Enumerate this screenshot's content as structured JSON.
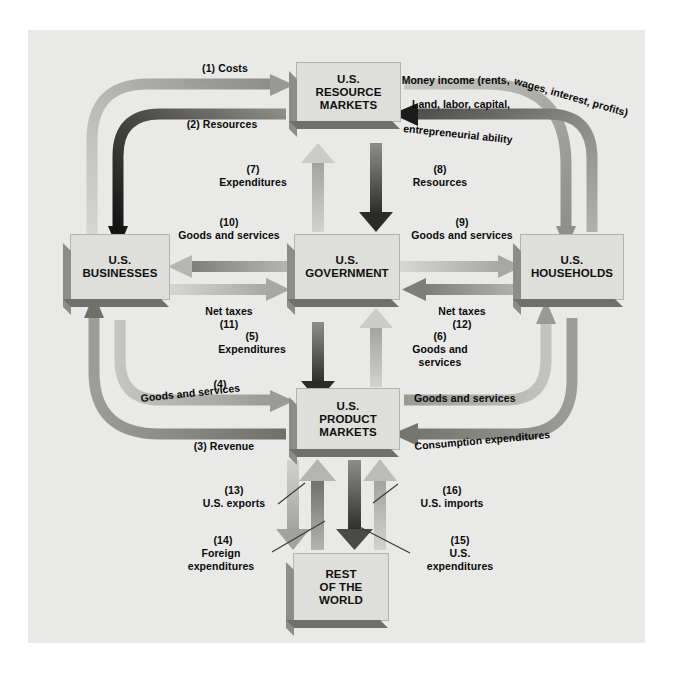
{
  "figure": {
    "type": "diagram",
    "background_color": "#e9e9e7",
    "box_fill": "#dededa"
  },
  "nodes": [
    {
      "id": "resource_markets",
      "label": "U.S.\nRESOURCE\nMARKETS",
      "line1": "U.S.",
      "line2": "RESOURCE",
      "line3": "MARKETS"
    },
    {
      "id": "businesses",
      "label": "U.S.\nBUSINESSES",
      "line1": "U.S.",
      "line2": "BUSINESSES",
      "line3": ""
    },
    {
      "id": "government",
      "label": "U.S.\nGOVERNMENT",
      "line1": "U.S.",
      "line2": "GOVERNMENT",
      "line3": ""
    },
    {
      "id": "households",
      "label": "U.S.\nHOUSEHOLDS",
      "line1": "U.S.",
      "line2": "HOUSEHOLDS",
      "line3": ""
    },
    {
      "id": "product_markets",
      "label": "U.S.\nPRODUCT\nMARKETS",
      "line1": "U.S.",
      "line2": "PRODUCT",
      "line3": "MARKETS"
    },
    {
      "id": "rest_of_world",
      "label": "REST\nOF THE\nWORLD",
      "line1": "REST",
      "line2": "OF THE",
      "line3": "WORLD"
    }
  ],
  "flows": [
    {
      "number": "(1)",
      "text": "Costs",
      "full": "(1) Costs",
      "from": "businesses",
      "to": "resource_markets"
    },
    {
      "number": "(2)",
      "text": "Resources",
      "full": "(2) Resources",
      "from": "resource_markets",
      "to": "businesses"
    },
    {
      "number": "(3)",
      "text": "Revenue",
      "full": "(3) Revenue",
      "from": "product_markets",
      "to": "businesses"
    },
    {
      "number": "(4)",
      "text": "Goods and services",
      "full": "Goods and services",
      "from": "businesses",
      "to": "product_markets"
    },
    {
      "number": "(5)",
      "text": "Expenditures",
      "full": "Expenditures",
      "from": "government",
      "to": "product_markets"
    },
    {
      "number": "(6)",
      "text": "Goods and\nservices",
      "full": "Goods and\nservices",
      "from": "product_markets",
      "to": "government"
    },
    {
      "number": "(7)",
      "text": "Expenditures",
      "full": "Expenditures",
      "from": "government",
      "to": "resource_markets"
    },
    {
      "number": "(8)",
      "text": "Resources",
      "full": "Resources",
      "from": "resource_markets",
      "to": "government"
    },
    {
      "number": "(9)",
      "text": "Goods and services",
      "full": "Goods and services",
      "from": "government",
      "to": "households"
    },
    {
      "number": "(10)",
      "text": "Goods and services",
      "full": "Goods and services",
      "from": "government",
      "to": "businesses"
    },
    {
      "number": "(11)",
      "text": "Net taxes",
      "full": "Net taxes",
      "from": "businesses",
      "to": "government"
    },
    {
      "number": "(12)",
      "text": "Net taxes",
      "full": "Net taxes",
      "from": "households",
      "to": "government"
    },
    {
      "number": "(13)",
      "text": "U.S. exports",
      "full": "U.S. exports",
      "from": "product_markets",
      "to": "rest_of_world"
    },
    {
      "number": "(14)",
      "text": "Foreign\nexpenditures",
      "full": "Foreign\nexpenditures",
      "from": "rest_of_world",
      "to": "product_markets"
    },
    {
      "number": "(15)",
      "text": "U.S.\nexpenditures",
      "full": "U.S.\nexpenditures",
      "from": "product_markets",
      "to": "rest_of_world"
    },
    {
      "number": "(16)",
      "text": "U.S. imports",
      "full": "U.S. imports",
      "from": "rest_of_world",
      "to": "product_markets"
    }
  ],
  "labels": {
    "costs": "(1) Costs",
    "resources_2": "(2) Resources",
    "revenue_3": "(3) Revenue",
    "goods_services_4_num": "(4)",
    "goods_services_4": "Goods and services",
    "expenditures_5_num": "(5)",
    "expenditures_5": "Expenditures",
    "goods_services_6_num": "(6)",
    "goods_services_6": "Goods and\nservices",
    "expenditures_7_num": "(7)",
    "expenditures_7": "Expenditures",
    "resources_8_num": "(8)",
    "resources_8": "Resources",
    "goods_services_9_num": "(9)",
    "goods_services_9": "Goods and services",
    "goods_services_10_num": "(10)",
    "goods_services_10": "Goods and services",
    "net_taxes_11": "Net taxes",
    "net_taxes_11_num": "(11)",
    "net_taxes_12": "Net taxes",
    "net_taxes_12_num": "(12)",
    "us_exports_num": "(13)",
    "us_exports": "U.S. exports",
    "foreign_expenditures_num": "(14)",
    "foreign_expenditures": "Foreign\nexpenditures",
    "us_expenditures_num": "(15)",
    "us_expenditures": "U.S.\nexpenditures",
    "us_imports_num": "(16)",
    "us_imports": "U.S. imports",
    "goods_and_services_right": "Goods and services",
    "consumption_expenditures": "Consumption expenditures",
    "money_income": "Money income (rents, wages, interest, profits)",
    "land_labor": "Land, labor, capital,",
    "entrepreneurial": "entrepreneurial ability"
  },
  "curved_text": {
    "money_income_part1": "Money income (rents, ",
    "money_income_part2": "wages, interest, profits)",
    "land_labor_capital": "Land, labor, capital,",
    "entrepreneurial_ability": "entrepreneurial ability",
    "goods_and_services_4": "Goods and services",
    "consumption_expenditures": "Consumption expenditures"
  },
  "colors": {
    "panel": "#e9e9e7",
    "box": "#dededa",
    "box_shadow_left": "#8d8d88",
    "box_shadow_bottom": "#6f6f6b",
    "arrow_light": "#c9c9c5",
    "arrow_mid": "#9a9a96",
    "arrow_dark": "#5a5a57",
    "arrow_black": "#1c1c1c",
    "text": "#0a0a0a"
  }
}
